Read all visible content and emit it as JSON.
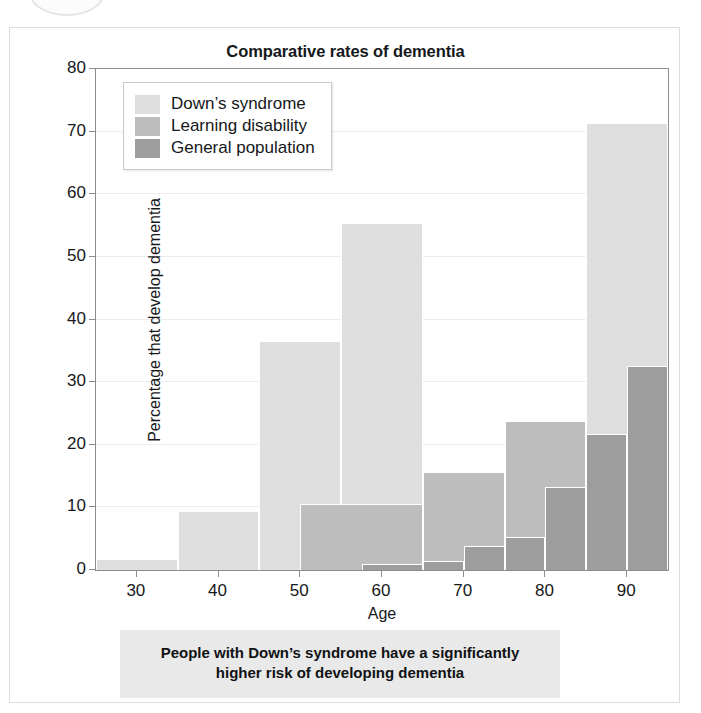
{
  "figure": {
    "title": "Comparative rates of dementia",
    "caption_line1": "People with Down’s syndrome have a significantly",
    "caption_line2": "higher risk of developing dementia"
  },
  "legend": {
    "items": [
      {
        "label": "Down’s syndrome",
        "color": "#dedede"
      },
      {
        "label": "Learning disability",
        "color": "#bdbdbd"
      },
      {
        "label": "General population",
        "color": "#9d9d9d"
      }
    ]
  },
  "chart_data": {
    "type": "bar",
    "title": "Comparative rates of dementia",
    "xlabel": "Age",
    "ylabel": "Percentage that develop dementia",
    "xlim": [
      25,
      95
    ],
    "ylim": [
      0,
      80
    ],
    "xticks": [
      30,
      40,
      50,
      60,
      70,
      80,
      90
    ],
    "yticks": [
      0,
      10,
      20,
      30,
      40,
      50,
      60,
      70,
      80
    ],
    "grid": true,
    "legend_position": "top-left",
    "series": [
      {
        "name": "Down’s syndrome",
        "color": "#dedede",
        "bins": [
          {
            "x0": 25,
            "x1": 35,
            "value": 1.8
          },
          {
            "x0": 35,
            "x1": 45,
            "value": 9.4
          },
          {
            "x0": 45,
            "x1": 55,
            "value": 36.5
          },
          {
            "x0": 55,
            "x1": 65,
            "value": 55.4
          },
          {
            "x0": 65,
            "x1": 75,
            "value": 15.7
          },
          {
            "x0": 75,
            "x1": 85,
            "value": 23.8
          },
          {
            "x0": 85,
            "x1": 95,
            "value": 71.3
          }
        ]
      },
      {
        "name": "Learning disability",
        "color": "#bdbdbd",
        "bins": [
          {
            "x0": 50,
            "x1": 65,
            "value": 10.6
          },
          {
            "x0": 65,
            "x1": 75,
            "value": 15.7
          },
          {
            "x0": 75,
            "x1": 85,
            "value": 23.8
          },
          {
            "x0": 85,
            "x1": 95,
            "value": 21.7
          }
        ]
      },
      {
        "name": "General population",
        "color": "#9d9d9d",
        "bins": [
          {
            "x0": 57.5,
            "x1": 65,
            "value": 0.9
          },
          {
            "x0": 65,
            "x1": 70,
            "value": 1.4
          },
          {
            "x0": 70,
            "x1": 75,
            "value": 3.9
          },
          {
            "x0": 75,
            "x1": 80,
            "value": 5.3
          },
          {
            "x0": 80,
            "x1": 85,
            "value": 13.2
          },
          {
            "x0": 85,
            "x1": 90,
            "value": 21.7
          },
          {
            "x0": 90,
            "x1": 95,
            "value": 32.5
          }
        ]
      }
    ]
  }
}
